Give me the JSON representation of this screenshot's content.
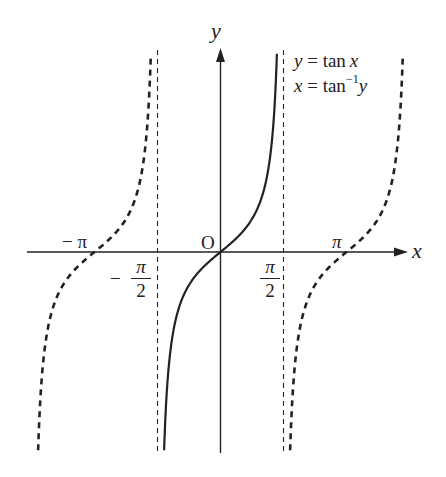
{
  "diagram": {
    "type": "function-graph",
    "axes": {
      "x_label": "x",
      "y_label": "y",
      "origin_label": "O"
    },
    "tick_labels": {
      "neg_pi": "− π",
      "pi": "π",
      "neg_half_pi": {
        "sign": "−",
        "numerator": "π",
        "denominator": "2"
      },
      "half_pi": {
        "numerator": "π",
        "denominator": "2"
      }
    },
    "legend": {
      "line1": {
        "lhs": "y",
        "eq": " = tan",
        "rhs": "x"
      },
      "line2": {
        "lhs": "x",
        "eq": " = tan",
        "sup": "−1",
        "rhs": "y"
      }
    },
    "curves": [
      {
        "name": "tan-principal-branch",
        "function": "y = tan x",
        "domain": "(-π/2, π/2)",
        "style": "solid"
      },
      {
        "name": "tan-left-branch",
        "function": "y = tan x",
        "domain": "(-3π/2, -π/2)",
        "style": "dashed"
      },
      {
        "name": "tan-right-branch",
        "function": "y = tan x",
        "domain": "(π/2, 3π/2)",
        "style": "dashed"
      }
    ],
    "asymptotes": [
      "x = -π/2",
      "x = π/2"
    ],
    "geometry": {
      "origin_px": [
        220.5,
        252
      ],
      "pi_px": 126,
      "unit_y_px": 33,
      "y_top": 50,
      "y_bottom": 453,
      "x_axis_start": 27,
      "x_axis_end": 408,
      "y_axis_top": 48
    },
    "colors": {
      "ink": "#222222",
      "background": "#ffffff"
    }
  }
}
